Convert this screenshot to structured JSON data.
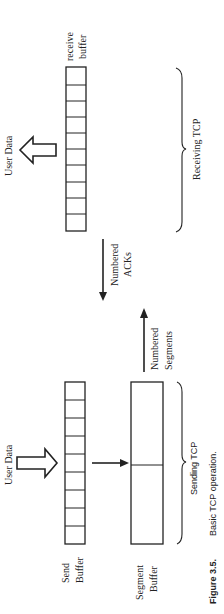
{
  "figure": {
    "number": "Figure 3.5.",
    "title": "Basic TCP operation."
  },
  "receiver": {
    "group_label": "Receiving TCP",
    "buffer_label_line1": "receive",
    "buffer_label_line2": "buffer",
    "user_data_label": "User Data",
    "buffer_cells": 10
  },
  "sender": {
    "group_label": "Sending TCP",
    "buffer_label_line1": "Send",
    "buffer_label_line2": "Buffer",
    "segment_label_line1": "Segment",
    "segment_label_line2": "Buffer",
    "user_data_label": "User Data",
    "buffer_cells": 9
  },
  "messages": {
    "acks_line1": "Numbered",
    "acks_line2": "ACKs",
    "segments_line1": "Numbered",
    "segments_line2": "Segments"
  }
}
